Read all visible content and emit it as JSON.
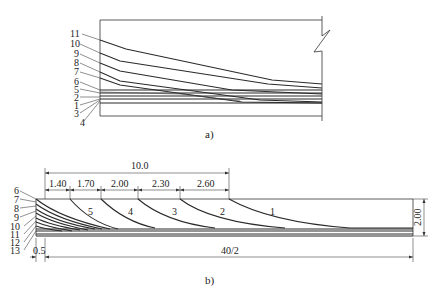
{
  "figure_a": {
    "caption": "a)",
    "tendon_labels": [
      "11",
      "10",
      "9",
      "8",
      "7",
      "6",
      "5",
      "2",
      "1",
      "3",
      "4"
    ]
  },
  "figure_b": {
    "caption": "b)",
    "tendon_labels_left": [
      "6",
      "7",
      "8",
      "9",
      "10",
      "11",
      "12",
      "13"
    ],
    "curve_labels": [
      "5",
      "4",
      "3",
      "2",
      "1"
    ],
    "dimensions": {
      "total_span": "10.0",
      "segments": [
        "1.40",
        "1.70",
        "2.00",
        "2.30",
        "2.60"
      ],
      "height": "2.00",
      "end_offset": "0.5",
      "half_length": "40/2"
    }
  },
  "colors": {
    "line": "#2a2a2a",
    "background": "#ffffff"
  }
}
